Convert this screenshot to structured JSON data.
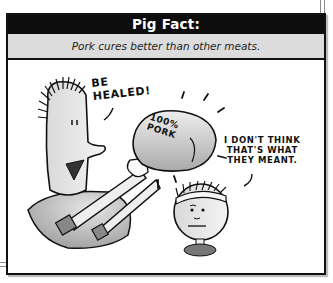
{
  "panel": {
    "title": "Pig Fact:",
    "fact": "Pork cures better than other meats."
  },
  "comic": {
    "man_speech": "BE\nHEALED!",
    "pork_label": "100%\nPORK",
    "kid_speech": "I DON'T THINK\nTHAT'S WHAT\nTHEY MEANT."
  },
  "colors": {
    "header_bg": "#0d0d0d",
    "header_text": "#ffffff",
    "subheader_bg": "#dcdcdc",
    "border": "#111111"
  }
}
